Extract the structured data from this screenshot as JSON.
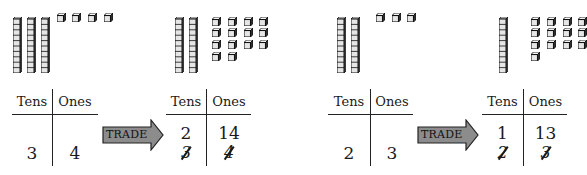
{
  "colors": {
    "ink": "#1a1a1a",
    "arrow_fill": "#8c8c8c",
    "cube_fill": "#e6e6e6"
  },
  "panels": [
    {
      "id": "example-34",
      "before": {
        "blocks": {
          "tens_rods": 3,
          "ones_cubes": 4
        },
        "table": {
          "headers": [
            "Tens",
            "Ones"
          ],
          "tens": "3",
          "ones": "4"
        }
      },
      "arrow_label": "TRADE",
      "after": {
        "blocks": {
          "tens_rods": 2,
          "ones_cubes": 14
        },
        "table": {
          "headers": [
            "Tens",
            "Ones"
          ],
          "tens_new": "2",
          "ones_new": "14",
          "tens_crossed": "3",
          "ones_crossed": "4"
        }
      }
    },
    {
      "id": "example-23",
      "before": {
        "blocks": {
          "tens_rods": 2,
          "ones_cubes": 3
        },
        "table": {
          "headers": [
            "Tens",
            "Ones"
          ],
          "tens": "2",
          "ones": "3"
        }
      },
      "arrow_label": "TRADE",
      "after": {
        "blocks": {
          "tens_rods": 1,
          "ones_cubes": 13
        },
        "table": {
          "headers": [
            "Tens",
            "Ones"
          ],
          "tens_new": "1",
          "ones_new": "13",
          "tens_crossed": "2",
          "ones_crossed": "3"
        }
      }
    }
  ]
}
